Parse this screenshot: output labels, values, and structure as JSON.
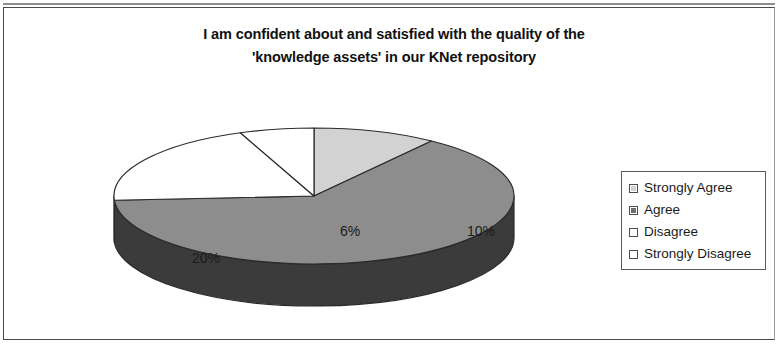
{
  "frame": {
    "border_color": "#4a4a4a"
  },
  "chart_data": {
    "type": "pie",
    "title": "I am confident about and satisfied with the quality of the 'knowledge assets' in our KNet repository",
    "title_lines": [
      "I am confident about and satisfied with the quality of the",
      "'knowledge assets' in our KNet repository"
    ],
    "three_d": true,
    "start_angle_deg": 0,
    "direction": "clockwise",
    "categories": [
      "Strongly Agree",
      "Agree",
      "Disagree",
      "Strongly Disagree"
    ],
    "values": [
      10,
      64,
      20,
      6
    ],
    "value_unit": "%",
    "data_labels": [
      "10%",
      "64%",
      "20%",
      "6%"
    ],
    "colors": [
      "#d2d2d2",
      "#8d8d8d",
      "#ffffff",
      "#ffffff"
    ],
    "side_colors": [
      "#6f6f6f",
      "#3b3b3b",
      "#8a8a8a",
      "#8a8a8a"
    ],
    "outline_color": "#2b2b2b",
    "legend_position": "right",
    "grid": false,
    "xlabel": "",
    "ylabel": ""
  },
  "legend": {
    "items": [
      {
        "label": "Strongly Agree",
        "color": "#d2d2d2"
      },
      {
        "label": "Agree",
        "color": "#6d6d6d"
      },
      {
        "label": "Disagree",
        "color": "#ffffff"
      },
      {
        "label": "Strongly Disagree",
        "color": "#ffffff"
      }
    ]
  }
}
